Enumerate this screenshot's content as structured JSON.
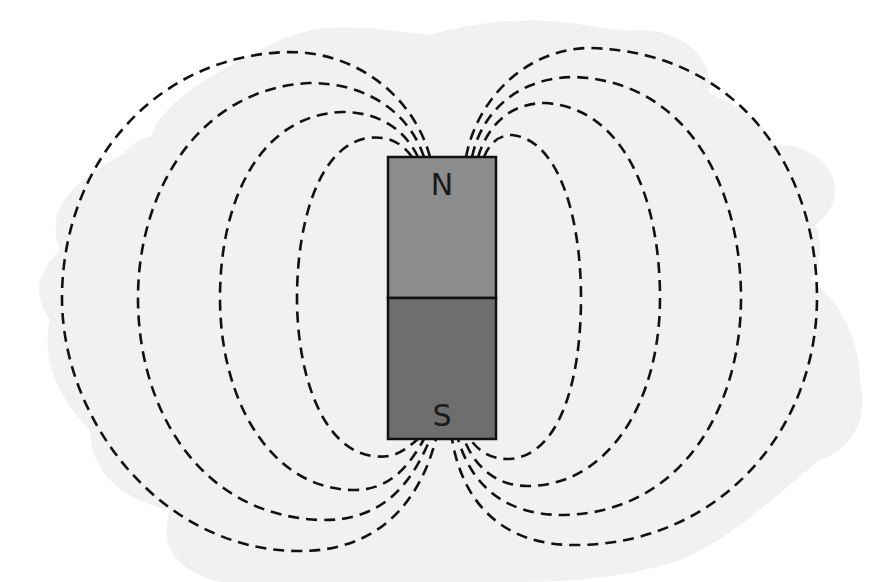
{
  "diagram": {
    "background_color": "#ffffff",
    "blob_color": "#f1f1f1",
    "magnet": {
      "x": 388,
      "y": 157,
      "width": 108,
      "height": 282,
      "north": {
        "label": "N",
        "color": "#8c8c8c"
      },
      "south": {
        "label": "S",
        "color": "#6e6e6e"
      },
      "outline_color": "#111111"
    },
    "field_lines": {
      "style": "dashed",
      "color": "#111111",
      "count_per_side": 4,
      "left": [
        {
          "id": "left-1",
          "leftmost_x": 297,
          "top_y": 138,
          "bottom_y": 456
        },
        {
          "id": "left-2",
          "leftmost_x": 220,
          "top_y": 112,
          "bottom_y": 490
        },
        {
          "id": "left-3",
          "leftmost_x": 138,
          "top_y": 83,
          "bottom_y": 520
        },
        {
          "id": "left-4",
          "leftmost_x": 62,
          "top_y": 52,
          "bottom_y": 551
        }
      ],
      "right": [
        {
          "id": "right-1",
          "rightmost_x": 581,
          "top_y": 135,
          "bottom_y": 459
        },
        {
          "id": "right-2",
          "rightmost_x": 660,
          "top_y": 103,
          "bottom_y": 486
        },
        {
          "id": "right-3",
          "rightmost_x": 741,
          "top_y": 77,
          "bottom_y": 515
        },
        {
          "id": "right-4",
          "rightmost_x": 817,
          "top_y": 48,
          "bottom_y": 545
        }
      ]
    }
  }
}
